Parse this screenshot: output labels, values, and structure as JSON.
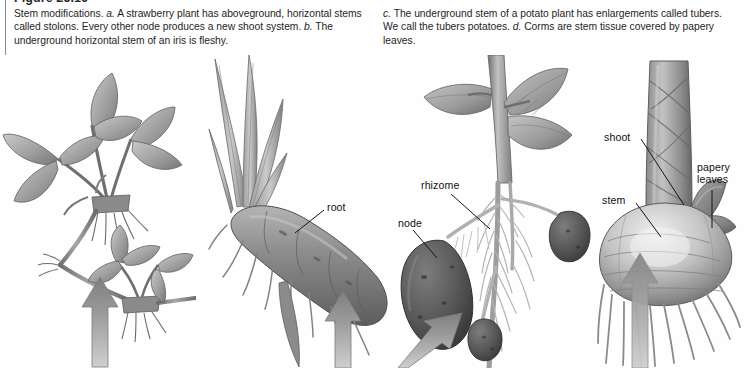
{
  "figure": {
    "title": "Figure 25.16",
    "caption_left_parts": [
      {
        "text": "Stem modifications. ",
        "style": "roman"
      },
      {
        "text": "a.",
        "style": "italic"
      },
      {
        "text": " A strawberry plant has aboveground, horizontal stems called stolons. Every other node produces a new shoot system. ",
        "style": "roman"
      },
      {
        "text": "b.",
        "style": "italic"
      },
      {
        "text": " The underground horizontal stem of an iris is fleshy.",
        "style": "roman"
      }
    ],
    "caption_right_parts": [
      {
        "text": "c.",
        "style": "italic"
      },
      {
        "text": " The underground stem of a potato plant has enlargements called tubers. We call the tubers potatoes. ",
        "style": "roman"
      },
      {
        "text": "d.",
        "style": "italic"
      },
      {
        "text": " Corms are stem tissue covered by papery leaves.",
        "style": "roman"
      }
    ],
    "caption_left_plain": "Stem modifications. a. A strawberry plant has aboveground, horizontal stems called stolons. Every other node produces a new shoot system. b. The underground horizontal stem of an iris is fleshy.",
    "caption_right_plain": "c. The underground stem of a potato plant has enlargements called tubers. We call the tubers potatoes. d. Corms are stem tissue covered by papery leaves."
  },
  "labels": {
    "root": "root",
    "rhizome": "rhizome",
    "node": "node",
    "shoot": "shoot",
    "stem": "stem",
    "papery_leaves_line1": "papery",
    "papery_leaves_line2": "leaves"
  },
  "panels": [
    {
      "key": "a",
      "name": "strawberry-plant-with-stolons"
    },
    {
      "key": "b",
      "name": "iris-rhizome"
    },
    {
      "key": "c",
      "name": "potato-plant-with-tubers"
    },
    {
      "key": "d",
      "name": "corm"
    }
  ],
  "colors": {
    "background": "#fefefe",
    "text": "#1f1f1f",
    "rule": "#8e8e8e",
    "leader_line": "#1a1a1a",
    "art_dark": "#555555",
    "art_mid": "#8d8d8d",
    "art_light": "#b9b9b9",
    "art_pale": "#d8d8d8",
    "arrow_gray": "#9a9a9a"
  }
}
